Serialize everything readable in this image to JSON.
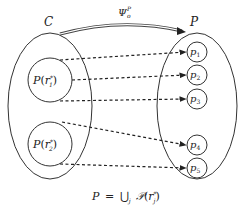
{
  "diagram": {
    "left_set": {
      "label": "C"
    },
    "right_set": {
      "label": "P"
    },
    "mapping": {
      "symbol": "Ψ",
      "superscript": "P",
      "subscript": "o"
    },
    "subsets": [
      {
        "label": "𝒫(r₁*)",
        "name": "P",
        "arg": "r",
        "sub": "1",
        "sup": "*"
      },
      {
        "label": "𝒫(r₂*)",
        "name": "P",
        "arg": "r",
        "sub": "2",
        "sup": "*"
      }
    ],
    "points": [
      {
        "label": "p",
        "sub": "1"
      },
      {
        "label": "p",
        "sub": "2"
      },
      {
        "label": "p",
        "sub": "3"
      },
      {
        "label": "p",
        "sub": "4"
      },
      {
        "label": "p",
        "sub": "5"
      }
    ],
    "edges": [
      {
        "from": "𝒫(r₁*)",
        "to": "p₁"
      },
      {
        "from": "𝒫(r₁*)",
        "to": "p₂"
      },
      {
        "from": "𝒫(r₁*)",
        "to": "p₃"
      },
      {
        "from": "𝒫(r₂*)",
        "to": "p₄"
      },
      {
        "from": "𝒫(r₂*)",
        "to": "p₅"
      }
    ],
    "caption": {
      "lhs": "P",
      "eq": "=",
      "union": "⋃",
      "union_sub": "j",
      "rhs_name": "𝒫",
      "rhs_arg": "r",
      "rhs_sub": "j",
      "rhs_sup": "*"
    },
    "colors": {
      "stroke": "#333333",
      "background": "#ffffff"
    }
  }
}
